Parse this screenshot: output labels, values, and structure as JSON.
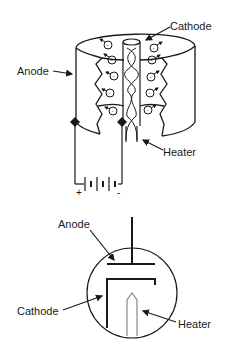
{
  "diagram": {
    "top": {
      "title": "Vacuum diode (cutaway view)",
      "labels": {
        "cathode": "Cathode",
        "anode": "Anode",
        "heater": "Heater"
      },
      "battery": {
        "plus": "+",
        "minus": "-"
      },
      "electron_symbol": "-"
    },
    "bottom": {
      "title": "Vacuum diode (schematic symbol)",
      "labels": {
        "anode": "Anode",
        "cathode": "Cathode",
        "heater": "Heater"
      }
    },
    "colors": {
      "stroke": "#1a1a1a",
      "heater_stroke": "#888888",
      "background": "#ffffff"
    }
  }
}
